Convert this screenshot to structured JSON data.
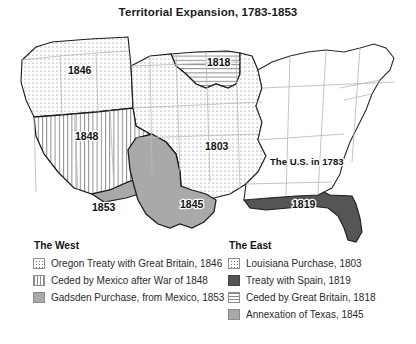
{
  "title": "Territorial Expansion, 1783-1853",
  "map": {
    "labels": [
      {
        "id": "oregon-1846",
        "text": "1846",
        "x": 68,
        "y": 52
      },
      {
        "id": "british-cession-1818",
        "text": "1818",
        "x": 207,
        "y": 44
      },
      {
        "id": "mexican-cession-1848",
        "text": "1848",
        "x": 75,
        "y": 118
      },
      {
        "id": "louisiana-1803",
        "text": "1803",
        "x": 205,
        "y": 128
      },
      {
        "id": "us-in-1783",
        "text": "The U.S. in 1783",
        "x": 270,
        "y": 143
      },
      {
        "id": "gadsden-1853",
        "text": "1853",
        "x": 92,
        "y": 189
      },
      {
        "id": "texas-1845",
        "text": "1845",
        "x": 180,
        "y": 186
      },
      {
        "id": "florida-1819",
        "text": "1819",
        "x": 292,
        "y": 186
      }
    ]
  },
  "legend": {
    "west": {
      "heading": "The West",
      "items": [
        {
          "pattern": "dotted-grid",
          "label": "Oregon Treaty with Great Britain, 1846"
        },
        {
          "pattern": "vertical-lines",
          "label": "Ceded by Mexico after War of 1848"
        },
        {
          "pattern": "solid-gray",
          "label": "Gadsden Purchase, from Mexico, 1853"
        }
      ]
    },
    "east": {
      "heading": "The East",
      "items": [
        {
          "pattern": "dotted-grid",
          "label": "Louisiana Purchase, 1803"
        },
        {
          "pattern": "solid-dark",
          "label": "Treaty with Spain, 1819"
        },
        {
          "pattern": "horizontal-lines",
          "label": "Ceded by Great Britain, 1818"
        },
        {
          "pattern": "solid-gray",
          "label": "Annexation of Texas, 1845"
        }
      ]
    }
  },
  "colors": {
    "solid_gray": "#a9a9a9",
    "solid_dark": "#555555",
    "outline": "#111111",
    "state_line": "#b8b8b8",
    "background": "#ffffff"
  }
}
